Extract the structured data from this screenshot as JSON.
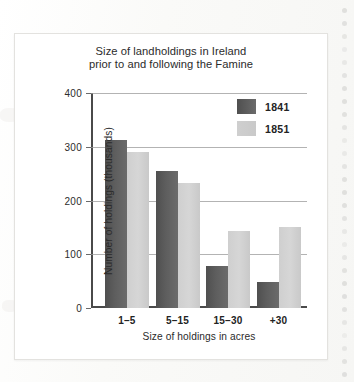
{
  "chart_data": {
    "type": "bar",
    "title": "Size of landholdings in Ireland prior to and following the Famine",
    "title_line1": "Size of landholdings in Ireland",
    "title_line2": "prior to and following the Famine",
    "xlabel": "Size of holdings in acres",
    "ylabel": "Number of holdings (thousands)",
    "categories": [
      "1–5",
      "5–15",
      "15–30",
      "+30"
    ],
    "series": [
      {
        "name": "1841",
        "color": "#5a5a5a",
        "values": [
          312,
          255,
          78,
          48
        ]
      },
      {
        "name": "1851",
        "color": "#d2d2d2",
        "values": [
          290,
          233,
          143,
          150
        ]
      }
    ],
    "ylim": [
      0,
      400
    ],
    "yticks": [
      400,
      300,
      200,
      100,
      0
    ],
    "ytick_labels": [
      "400",
      "300",
      "200",
      "100",
      "0"
    ],
    "grid": true,
    "grid_axis": "y",
    "legend_position": "top-right"
  },
  "legend": {
    "entries": [
      {
        "label": "1841"
      },
      {
        "label": "1851"
      }
    ]
  }
}
